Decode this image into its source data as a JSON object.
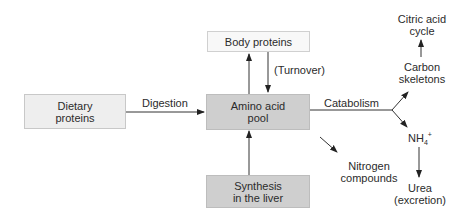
{
  "diagram": {
    "nodes": {
      "dietary": "Dietary proteins",
      "dietary_l1": "Dietary",
      "dietary_l2": "proteins",
      "pool_l1": "Amino acid",
      "pool_l2": "pool",
      "body": "Body proteins",
      "synth_l1": "Synthesis",
      "synth_l2": "in the liver"
    },
    "edges": {
      "digestion": "Digestion",
      "turnover": "(Turnover)",
      "catabolism": "Catabolism"
    },
    "outputs": {
      "citric_l1": "Citric acid",
      "citric_l2": "cycle",
      "carbon_l1": "Carbon",
      "carbon_l2": "skeletons",
      "nh4": "NH",
      "nh4_sub": "4",
      "nh4_sup": "+",
      "nitrogen_l1": "Nitrogen",
      "nitrogen_l2": "compounds",
      "urea_l1": "Urea",
      "urea_l2": "(excretion)"
    }
  }
}
